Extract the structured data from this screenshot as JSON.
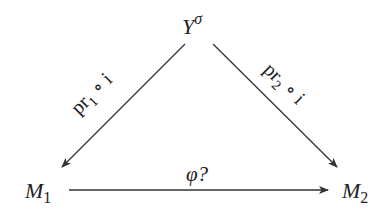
{
  "diagram": {
    "type": "commutative-triangle",
    "nodes": {
      "top": {
        "base": "Y",
        "superscript": "σ"
      },
      "left": {
        "base": "M",
        "subscript": "1"
      },
      "right": {
        "base": "M",
        "subscript": "2"
      }
    },
    "arrows": {
      "left_diag": {
        "from": "top",
        "to": "left",
        "label_main": "pr",
        "label_sub": "1",
        "label_rest": " ∘ i"
      },
      "right_diag": {
        "from": "top",
        "to": "right",
        "label_main": "pr",
        "label_sub": "2",
        "label_rest": " ∘ i"
      },
      "bottom": {
        "from": "left",
        "to": "right",
        "label": "φ?"
      }
    },
    "colors": {
      "line": "#333333",
      "text": "#222222",
      "background": "#ffffff"
    }
  }
}
